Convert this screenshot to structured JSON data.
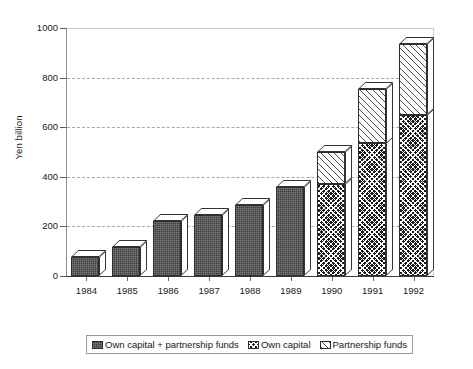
{
  "chart_data": {
    "type": "bar",
    "title": "",
    "subtitle": "",
    "xlabel": "",
    "ylabel": "Yen billion",
    "ylim": [
      0,
      1000
    ],
    "yticks": [
      0,
      200,
      400,
      600,
      800,
      1000
    ],
    "ytick_labels": [
      "0",
      "200",
      "400",
      "600",
      "800",
      "1000"
    ],
    "grid": true,
    "grid_axis": "y",
    "grid_style": "dashed",
    "stacked": true,
    "legend_position": "bottom",
    "categories": [
      "1984",
      "1985",
      "1986",
      "1987",
      "1988",
      "1989",
      "1990",
      "1991",
      "1992"
    ],
    "series": [
      {
        "name": "Own capital + partnership funds",
        "pattern": "solid-dark",
        "values": [
          75,
          118,
          220,
          245,
          285,
          358,
          null,
          null,
          null
        ]
      },
      {
        "name": "Own capital",
        "pattern": "crosshatch-dark",
        "values": [
          null,
          null,
          null,
          null,
          null,
          null,
          370,
          535,
          650
        ]
      },
      {
        "name": "Partnership funds",
        "pattern": "diagonal-hatch-light",
        "values": [
          null,
          null,
          null,
          null,
          null,
          null,
          130,
          220,
          285
        ]
      }
    ],
    "totals": [
      75,
      118,
      220,
      245,
      285,
      358,
      500,
      755,
      935
    ]
  },
  "legend": {
    "items": [
      {
        "label": "Own capital + partnership funds",
        "swatch": "solid-dark"
      },
      {
        "label": "Own capital",
        "swatch": "crosshatch-dark"
      },
      {
        "label": "Partnership funds",
        "swatch": "diagonal-hatch-light"
      }
    ]
  },
  "colors": {
    "solid_dark": "#3c3c3c",
    "crosshatch_dark": "#1b1b1b",
    "hatch_light": "#ffffff",
    "axis": "#3a3a3a",
    "grid": "#a8a8a8",
    "background": "#ffffff"
  }
}
